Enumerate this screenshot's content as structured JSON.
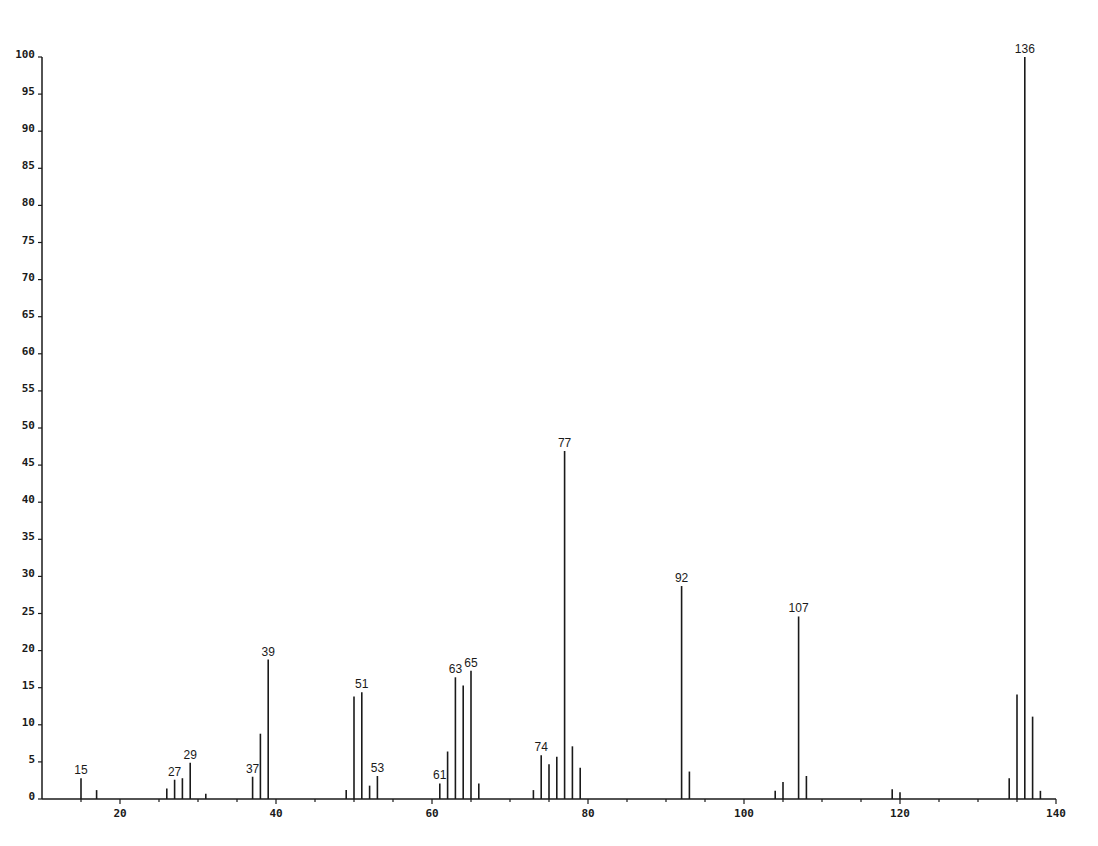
{
  "chart_data": {
    "type": "bar",
    "subtype": "mass-spectrum-stick",
    "title": "",
    "xlabel": "",
    "ylabel": "",
    "xlim": [
      10,
      140
    ],
    "ylim": [
      0,
      100
    ],
    "grid": false,
    "legend": null,
    "x_ticks": [
      20,
      40,
      60,
      80,
      100,
      120,
      140
    ],
    "x_tick_labels": [
      "20",
      "40",
      "60",
      "80",
      "100",
      "120",
      "140"
    ],
    "x_minor_tick_step": 5,
    "y_ticks": [
      0,
      5,
      10,
      15,
      20,
      25,
      30,
      35,
      40,
      45,
      50,
      55,
      60,
      65,
      70,
      75,
      80,
      85,
      90,
      95,
      100
    ],
    "y_tick_labels": [
      "0",
      "5",
      "10",
      "15",
      "20",
      "25",
      "30",
      "35",
      "40",
      "45",
      "50",
      "55",
      "60",
      "65",
      "70",
      "75",
      "80",
      "85",
      "90",
      "95",
      "100"
    ],
    "x": [
      15,
      17,
      26,
      27,
      28,
      29,
      31,
      37,
      38,
      39,
      49,
      50,
      51,
      52,
      53,
      61,
      62,
      63,
      64,
      65,
      66,
      73,
      74,
      75,
      76,
      77,
      78,
      79,
      92,
      93,
      104,
      105,
      107,
      108,
      119,
      120,
      134,
      135,
      136,
      137,
      138
    ],
    "values": [
      2.8,
      1.2,
      1.4,
      2.6,
      2.8,
      4.9,
      0.7,
      3.0,
      8.8,
      18.8,
      1.2,
      13.8,
      14.4,
      1.8,
      3.1,
      2.1,
      6.4,
      16.4,
      15.3,
      17.3,
      2.1,
      1.2,
      5.9,
      4.7,
      5.7,
      46.9,
      7.1,
      4.2,
      28.7,
      3.7,
      1.1,
      2.3,
      24.6,
      3.1,
      1.3,
      0.9,
      2.8,
      14.1,
      100,
      11.1,
      1.1
    ],
    "annotations": [
      {
        "x": 15,
        "label": "15"
      },
      {
        "x": 27,
        "label": "27"
      },
      {
        "x": 29,
        "label": "29"
      },
      {
        "x": 37,
        "label": "37"
      },
      {
        "x": 39,
        "label": "39"
      },
      {
        "x": 51,
        "label": "51"
      },
      {
        "x": 53,
        "label": "53"
      },
      {
        "x": 61,
        "label": "61"
      },
      {
        "x": 63,
        "label": "63"
      },
      {
        "x": 65,
        "label": "65"
      },
      {
        "x": 74,
        "label": "74"
      },
      {
        "x": 77,
        "label": "77"
      },
      {
        "x": 92,
        "label": "92"
      },
      {
        "x": 107,
        "label": "107"
      },
      {
        "x": 136,
        "label": "136"
      }
    ]
  }
}
